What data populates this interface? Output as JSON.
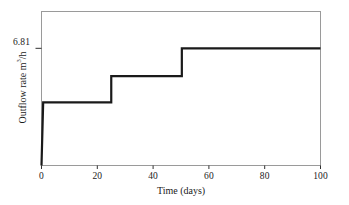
{
  "chart_data": {
    "type": "line",
    "subtype": "step",
    "title": "",
    "xlabel": "Time (days)",
    "ylabel_text": "Outflow rate m",
    "ylabel_exponent": "3",
    "ylabel_suffix": "/h",
    "ylabel_full": "Outflow rate m3/h",
    "xlim": [
      0,
      100
    ],
    "ylim": [
      0,
      8.95
    ],
    "xticks": [
      0,
      20,
      40,
      60,
      80,
      100
    ],
    "xtick_labels": [
      "0",
      "20",
      "40",
      "60",
      "80",
      "100"
    ],
    "yticks": [
      6.81
    ],
    "ytick_labels": [
      "6.81"
    ],
    "grid": false,
    "legend": false,
    "line_color": "#1a1a1a",
    "line_width": 2.2,
    "frame_color": "#9a9a9a",
    "background": "#ffffff",
    "series": [
      {
        "name": "Outflow rate",
        "x": [
          0,
          0.6,
          25,
          25,
          50.3,
          50.3,
          100
        ],
        "y": [
          0,
          3.67,
          3.67,
          5.2,
          5.2,
          6.81,
          6.81
        ]
      }
    ],
    "steps": [
      {
        "start_day": 0.6,
        "end_day": 25,
        "value": 3.67
      },
      {
        "start_day": 25,
        "end_day": 50.3,
        "value": 5.2
      },
      {
        "start_day": 50.3,
        "end_day": 100,
        "value": 6.81
      }
    ],
    "annotations": [
      {
        "label": "6.81",
        "axis": "y",
        "value": 6.81
      }
    ]
  }
}
